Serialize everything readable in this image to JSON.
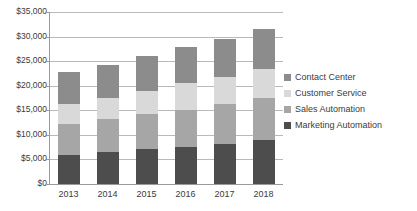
{
  "chart_data": {
    "type": "bar",
    "subtype": "stacked-vertical",
    "title": "",
    "xlabel": "",
    "ylabel": "",
    "categories": [
      "2013",
      "2014",
      "2015",
      "2016",
      "2017",
      "2018"
    ],
    "ylim": [
      0,
      35000
    ],
    "ytick_values": [
      0,
      5000,
      10000,
      15000,
      20000,
      25000,
      30000,
      35000
    ],
    "ytick_labels": [
      "$0",
      "$5,000",
      "$10,000",
      "$15,000",
      "$20,000",
      "$25,000",
      "$30,000",
      "$35,000"
    ],
    "grid": true,
    "legend_position": "right",
    "series": [
      {
        "name": "Marketing Automation",
        "color": "#4d4d4d",
        "values": [
          5900,
          6500,
          7100,
          7600,
          8200,
          9000
        ]
      },
      {
        "name": "Sales Automation",
        "color": "#a6a6a6",
        "values": [
          6300,
          6700,
          7100,
          7400,
          8100,
          8500
        ]
      },
      {
        "name": "Customer Service",
        "color": "#d9d9d9",
        "values": [
          4000,
          4300,
          4800,
          5500,
          5500,
          6000
        ]
      },
      {
        "name": "Contact Center",
        "color": "#8c8c8c",
        "values": [
          6500,
          6800,
          7000,
          7300,
          7800,
          8100
        ]
      }
    ],
    "totals": [
      22700,
      24300,
      26000,
      27800,
      29600,
      31600
    ],
    "stack_order_bottom_to_top": [
      "Marketing Automation",
      "Sales Automation",
      "Customer Service",
      "Contact Center"
    ]
  },
  "legend": {
    "items": [
      {
        "label": "Contact Center",
        "color": "#8c8c8c"
      },
      {
        "label": "Customer Service",
        "color": "#d9d9d9"
      },
      {
        "label": "Sales Automation",
        "color": "#a6a6a6"
      },
      {
        "label": "Marketing Automation",
        "color": "#4d4d4d"
      }
    ]
  },
  "axis": {
    "gridline_color": "#b9b9b9",
    "axis_color": "#9a9a9a"
  }
}
